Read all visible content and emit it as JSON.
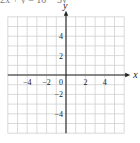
{
  "header": {
    "cut_text": "2x + y = 10 − 3y"
  },
  "chart_data": {
    "type": "line",
    "title": "",
    "xlabel": "x",
    "ylabel": "y",
    "xlim": [
      -6,
      6
    ],
    "ylim": [
      -6,
      6
    ],
    "grid": true,
    "x_ticks": [
      -4,
      -2,
      0,
      2,
      4
    ],
    "y_ticks": [
      4,
      2,
      -2,
      -4
    ],
    "x_tick_labels": [
      "−4",
      "−2",
      "0",
      "2",
      "4"
    ],
    "y_tick_labels": [
      "4",
      "2",
      "−2",
      "−4"
    ],
    "series": []
  },
  "colors": {
    "grid": "#d0d0d0",
    "axis": "#222222",
    "text": "#222222"
  }
}
